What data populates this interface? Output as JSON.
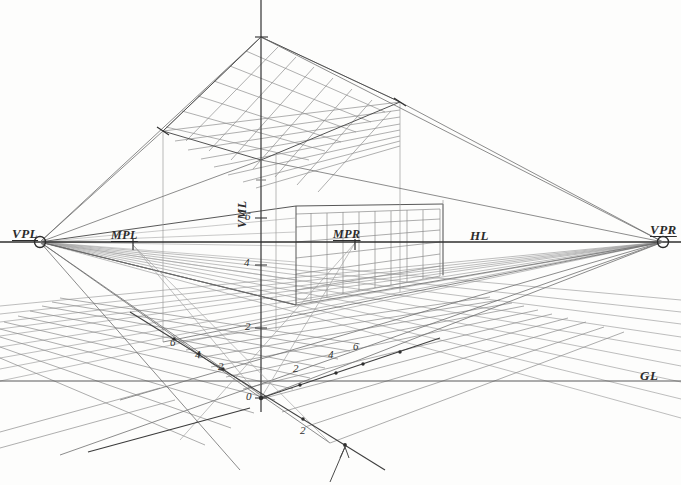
{
  "labels": {
    "vpl": "VPL",
    "mpl": "MPL",
    "mpr": "MPR",
    "vpr": "VPR",
    "hl": "HL",
    "gl": "GL",
    "vml": "VML"
  },
  "scales": {
    "vertical_label": "Vertical Measuring Line",
    "vertical_marks": [
      {
        "value": "6",
        "y": 218
      },
      {
        "value": "4",
        "y": 265
      },
      {
        "value": "2",
        "y": 328
      },
      {
        "value": "0",
        "y": 398
      }
    ],
    "ground_left_marks": [
      {
        "value": "6",
        "x": 174,
        "y": 344
      },
      {
        "value": "4",
        "x": 199,
        "y": 355
      },
      {
        "value": "2",
        "x": 221,
        "y": 366
      }
    ],
    "ground_right_marks": [
      {
        "value": "2",
        "x": 296,
        "y": 369
      },
      {
        "value": "4",
        "x": 331,
        "y": 355
      },
      {
        "value": "6",
        "x": 356,
        "y": 347
      }
    ],
    "below_ground_marks": [
      {
        "value": "2",
        "x": 303,
        "y": 432
      }
    ]
  },
  "geometry": {
    "vpl": {
      "x": 40,
      "y": 242
    },
    "vpr": {
      "x": 663,
      "y": 242
    },
    "mpl": {
      "x": 133,
      "y": 245
    },
    "mpr": {
      "x": 355,
      "y": 243
    },
    "station": {
      "x": 261,
      "y": 398
    },
    "horizon_y": 242,
    "ground_line_y": 381,
    "vml_x": 261,
    "ceiling_apex": {
      "x": 261,
      "y": 37
    },
    "ceiling_left": {
      "x": 163,
      "y": 131
    },
    "ceiling_right": {
      "x": 400,
      "y": 102
    },
    "ceiling_near": {
      "x": 261,
      "y": 160
    },
    "wall_left_x": 163,
    "wall_right_x": 400,
    "box_near_x": 261
  },
  "colors": {
    "ink": "#3a3a3a",
    "ink_light": "#8d8d8d",
    "ink_faint": "#b6b6b6",
    "paper": "#fdfdfc",
    "accent": "#2b2b2b"
  },
  "style_notes": {
    "medium": "pencil on paper",
    "technique": "two-point perspective with measuring points"
  }
}
